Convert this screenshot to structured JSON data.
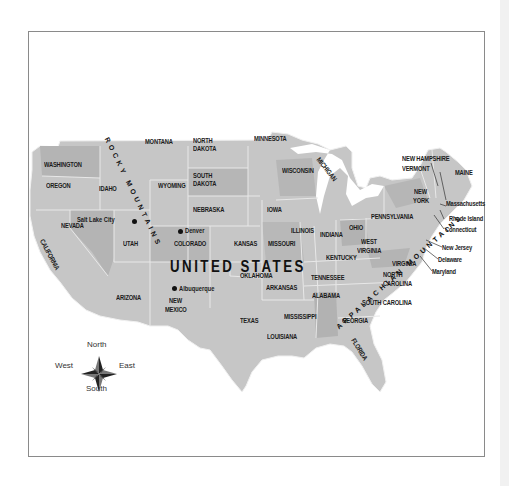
{
  "map": {
    "country_label": "UNITED STATES",
    "mountain_ranges": {
      "rocky": "ROCKY MOUNTAINS",
      "appalachian": "APPALACHIAN MOUNTAINS"
    },
    "states": {
      "washington": "WASHINGTON",
      "oregon": "OREGON",
      "california": "CALIFORNIA",
      "idaho": "IDAHO",
      "nevada": "NEVADA",
      "montana": "MONTANA",
      "wyoming": "WYOMING",
      "utah": "UTAH",
      "arizona": "ARIZONA",
      "colorado": "COLORADO",
      "new_mexico_1": "NEW",
      "new_mexico_2": "MEXICO",
      "north_dakota_1": "NORTH",
      "north_dakota_2": "DAKOTA",
      "south_dakota_1": "SOUTH",
      "south_dakota_2": "DAKOTA",
      "nebraska": "NEBRASKA",
      "kansas": "KANSAS",
      "oklahoma": "OKLAHOMA",
      "texas": "TEXAS",
      "minnesota": "MINNESOTA",
      "iowa": "IOWA",
      "missouri": "MISSOURI",
      "arkansas": "ARKANSAS",
      "louisiana": "LOUISIANA",
      "wisconsin": "WISCONSIN",
      "illinois": "ILLINOIS",
      "michigan": "MICHIGAN",
      "indiana": "INDIANA",
      "ohio": "OHIO",
      "kentucky": "KENTUCKY",
      "tennessee": "TENNESSEE",
      "mississippi": "MISSISSIPPI",
      "alabama": "ALABAMA",
      "georgia": "GEORGIA",
      "florida": "FLORIDA",
      "south_carolina": "SOUTH CAROLINA",
      "north_carolina_1": "NORTH",
      "north_carolina_2": "CAROLINA",
      "virginia": "VIRGINIA",
      "west_virginia_1": "WEST",
      "west_virginia_2": "VIRGINIA",
      "pennsylvania": "PENNSYLVANIA",
      "new_york_1": "NEW",
      "new_york_2": "YORK",
      "vermont": "VERMONT",
      "new_hampshire": "NEW HAMPSHIRE",
      "maine": "MAINE",
      "massachusetts": "Massachusetts",
      "rhode_island": "Rhode Island",
      "connecticut": "Connecticut",
      "new_jersey": "New Jersey",
      "delaware": "Delaware",
      "maryland": "Maryland"
    },
    "cities": {
      "salt_lake_city": "Salt Lake City",
      "denver": "Denver",
      "albuquerque": "Albuquerque"
    },
    "compass": {
      "north": "North",
      "south": "South",
      "east": "East",
      "west": "West"
    },
    "colors": {
      "land_light": "#c9c9c9",
      "land_mid": "#b9b9b9",
      "land_dark": "#a9a9a9",
      "border": "#e6e6e6",
      "water": "#ffffff",
      "frame": "#8a8a8a"
    }
  }
}
